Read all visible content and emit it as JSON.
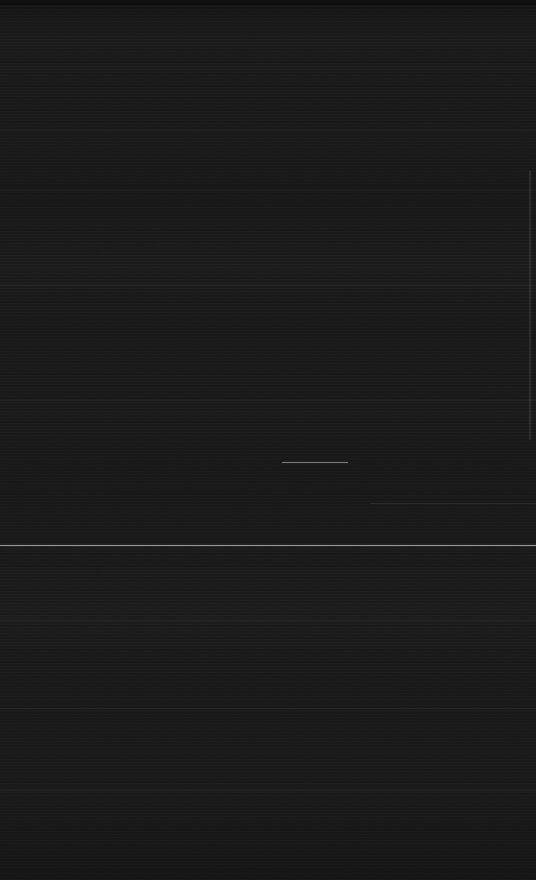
{
  "capture": {
    "width": 536,
    "height": 880,
    "orientation": "portrait",
    "state_label": "",
    "legible_text": "",
    "note": ""
  },
  "colors": {
    "background": "#181818",
    "background_darkest": "#101010",
    "background_lightest": "#1c1c1c",
    "divider_bright": "#e2e2e2",
    "divider_faint": "#2a2a2a",
    "segment": "#d0d0d0",
    "scrollbar_thumb": "#2e2e2e"
  },
  "regions": {
    "status_strip": {
      "top": 0,
      "height": 5
    },
    "upper_pane": {
      "top": 5,
      "height": 540
    },
    "lower_pane": {
      "top": 546,
      "height": 334
    }
  },
  "dividers": [
    {
      "name": "separator-1",
      "y": 130,
      "kind": "faint",
      "full_width": true
    },
    {
      "name": "separator-2",
      "y": 190,
      "kind": "faint",
      "full_width": true
    },
    {
      "name": "separator-3",
      "y": 285,
      "kind": "faint",
      "full_width": true
    },
    {
      "name": "separator-4",
      "y": 400,
      "kind": "faint",
      "full_width": true
    },
    {
      "name": "separator-5",
      "y": 503,
      "kind": "faint",
      "full_width": false
    },
    {
      "name": "separator-6",
      "y": 620,
      "kind": "faint",
      "full_width": true
    },
    {
      "name": "separator-7",
      "y": 708,
      "kind": "faint",
      "full_width": true
    },
    {
      "name": "separator-8",
      "y": 790,
      "kind": "faint",
      "full_width": true
    }
  ],
  "primary_rule": {
    "name": "section-divider",
    "y": 545
  },
  "segment": {
    "name": "highlight-segment",
    "x": 282,
    "y": 462,
    "width": 66
  },
  "scrollbar": {
    "name": "scrollbar-thumb",
    "x": 529,
    "y": 170,
    "height": 270
  }
}
